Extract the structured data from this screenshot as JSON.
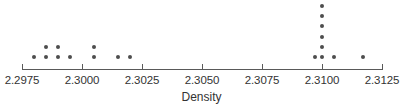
{
  "chart_data": {
    "type": "scatter",
    "plot_style": "dotplot",
    "title": "",
    "xlabel": "Density",
    "ylabel": "",
    "xlim": [
      2.2975,
      2.3125
    ],
    "xticks": [
      2.2975,
      2.3,
      2.3025,
      2.305,
      2.3075,
      2.31,
      2.3125
    ],
    "xtick_labels": [
      "2.2975",
      "2.3000",
      "2.3025",
      "2.3050",
      "2.3075",
      "2.3100",
      "2.3125"
    ],
    "grid": false,
    "legend": false,
    "dot_color": "#4d4d4d",
    "axis_color": "#595959",
    "values": [
      2.298,
      2.2985,
      2.2985,
      2.299,
      2.299,
      2.2995,
      2.3005,
      2.3005,
      2.3015,
      2.302,
      2.3097,
      2.31,
      2.31,
      2.31,
      2.31,
      2.31,
      2.31,
      2.3105,
      2.3117
    ],
    "stacks": [
      {
        "value": 2.298,
        "count": 1
      },
      {
        "value": 2.2985,
        "count": 2
      },
      {
        "value": 2.299,
        "count": 2
      },
      {
        "value": 2.2995,
        "count": 1
      },
      {
        "value": 2.3005,
        "count": 2
      },
      {
        "value": 2.3015,
        "count": 1
      },
      {
        "value": 2.302,
        "count": 1
      },
      {
        "value": 2.3097,
        "count": 1
      },
      {
        "value": 2.31,
        "count": 6
      },
      {
        "value": 2.3105,
        "count": 1
      },
      {
        "value": 2.3117,
        "count": 1
      }
    ],
    "n": 19
  }
}
